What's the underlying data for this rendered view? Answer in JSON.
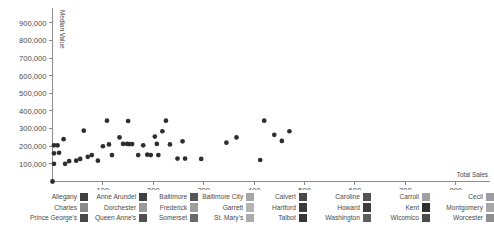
{
  "chart_data": {
    "type": "scatter",
    "title": "",
    "xlabel": "Total Sales",
    "ylabel": "Median Value",
    "xlim": [
      0,
      860
    ],
    "ylim": [
      0,
      950000
    ],
    "xticks": [
      100,
      200,
      300,
      400,
      500,
      600,
      700,
      800
    ],
    "yticks": [
      100000,
      200000,
      300000,
      400000,
      500000,
      600000,
      700000,
      800000,
      900000
    ],
    "xtick_labels": [
      "100",
      "200",
      "300",
      "400",
      "500",
      "600",
      "700",
      "800"
    ],
    "ytick_labels": [
      "100,000",
      "200,000",
      "300,000",
      "400,000",
      "500,000",
      "600,000",
      "700,000",
      "800,000",
      "900,000"
    ],
    "grid": false,
    "legend_position": "bottom",
    "marker_color": "#2e2e2e",
    "points": [
      {
        "name": "Allegany",
        "x": 8,
        "y": 100000
      },
      {
        "name": "Anne Arundel",
        "x": 300,
        "y": 345000
      },
      {
        "name": "Baltimore",
        "x": 440,
        "y": 265000
      },
      {
        "name": "Baltimore City",
        "x": 415,
        "y": 122000
      },
      {
        "name": "Calvert",
        "x": 80,
        "y": 330000
      },
      {
        "name": "Caroline",
        "x": 20,
        "y": 205000
      },
      {
        "name": "Carroll",
        "x": 150,
        "y": 285000
      },
      {
        "name": "Cecil",
        "x": 120,
        "y": 213000
      },
      {
        "name": "Charles",
        "x": 250,
        "y": 250000
      },
      {
        "name": "Dorchester",
        "x": 30,
        "y": 147000
      },
      {
        "name": "Frederick",
        "x": 205,
        "y": 213000
      },
      {
        "name": "Garrett",
        "x": 10,
        "y": 200000
      },
      {
        "name": "Harford",
        "x": 175,
        "y": 130000
      },
      {
        "name": "Howard",
        "x": 375,
        "y": 230000
      },
      {
        "name": "Kent",
        "x": 60,
        "y": 118000
      },
      {
        "name": "Montgomery",
        "x": 470,
        "y": 285000
      },
      {
        "name": "Prince George's",
        "x": 325,
        "y": 260000
      },
      {
        "name": "Queen Anne's",
        "x": 35,
        "y": 240000
      },
      {
        "name": "St. Mary's",
        "x": 95,
        "y": 142000
      },
      {
        "name": "Somerset",
        "x": 225,
        "y": 215000
      },
      {
        "name": "Talbot",
        "x": 135,
        "y": 205000
      },
      {
        "name": "Washington",
        "x": 255,
        "y": 215000
      },
      {
        "name": "Wicomico",
        "x": 185,
        "y": 215000
      },
      {
        "name": "Worcester",
        "x": 265,
        "y": 212000
      }
    ],
    "scatter_xy": [
      [
        3,
        205000
      ],
      [
        3,
        160000
      ],
      [
        3,
        100000
      ],
      [
        10,
        205000
      ],
      [
        13,
        163000
      ],
      [
        22,
        240000
      ],
      [
        25,
        100000
      ],
      [
        33,
        115000
      ],
      [
        47,
        118000
      ],
      [
        55,
        128000
      ],
      [
        62,
        288000
      ],
      [
        70,
        140000
      ],
      [
        78,
        150000
      ],
      [
        90,
        118000
      ],
      [
        100,
        200000
      ],
      [
        108,
        345000
      ],
      [
        112,
        210000
      ],
      [
        118,
        150000
      ],
      [
        133,
        250000
      ],
      [
        140,
        213000
      ],
      [
        148,
        213000
      ],
      [
        150,
        343000
      ],
      [
        152,
        212000
      ],
      [
        158,
        212000
      ],
      [
        170,
        150000
      ],
      [
        180,
        205000
      ],
      [
        188,
        152000
      ],
      [
        195,
        150000
      ],
      [
        203,
        255000
      ],
      [
        207,
        213000
      ],
      [
        210,
        150000
      ],
      [
        218,
        285000
      ],
      [
        225,
        345000
      ],
      [
        233,
        210000
      ],
      [
        248,
        130000
      ],
      [
        258,
        228000
      ],
      [
        263,
        130000
      ],
      [
        295,
        128000
      ],
      [
        345,
        220000
      ],
      [
        365,
        250000
      ],
      [
        412,
        122000
      ],
      [
        420,
        345000
      ],
      [
        440,
        265000
      ],
      [
        455,
        230000
      ],
      [
        470,
        285000
      ]
    ]
  },
  "axes": {
    "y_label": "Median Value",
    "x_label": "Total Sales"
  },
  "legend": {
    "columns": [
      {
        "entries": [
          {
            "label": "Allegany",
            "color": "#3f3f3f"
          },
          {
            "label": "Charles",
            "color": "#8a8a8a"
          },
          {
            "label": "Prince George's",
            "color": "#4a4a4a"
          }
        ]
      },
      {
        "entries": [
          {
            "label": "Anne Arundel",
            "color": "#404040"
          },
          {
            "label": "Dorchester",
            "color": "#9a9a9a"
          },
          {
            "label": "Queen Anne's",
            "color": "#4f4f4f"
          }
        ]
      },
      {
        "entries": [
          {
            "label": "Baltimore",
            "color": "#565656"
          },
          {
            "label": "Frederick",
            "color": "#9e9e9e"
          },
          {
            "label": "Somerset",
            "color": "#6a6a6a"
          }
        ]
      },
      {
        "entries": [
          {
            "label": "Baltimore City",
            "color": "#a6a6a6"
          },
          {
            "label": "Garrett",
            "color": "#b4b4b4"
          },
          {
            "label": "St. Mary's",
            "color": "#acacac"
          }
        ]
      },
      {
        "entries": [
          {
            "label": "Calvert",
            "color": "#4a4a4a"
          },
          {
            "label": "Hartford",
            "color": "#3b3b3b"
          },
          {
            "label": "Talbot",
            "color": "#363636"
          }
        ]
      },
      {
        "entries": [
          {
            "label": "Caroline",
            "color": "#525252"
          },
          {
            "label": "Howard",
            "color": "#3d3d3d"
          },
          {
            "label": "Washington",
            "color": "#5e5e5e"
          }
        ]
      },
      {
        "entries": [
          {
            "label": "Carroll",
            "color": "#a0a0a0"
          },
          {
            "label": "Kent",
            "color": "#2f2f2f"
          },
          {
            "label": "Wicomico",
            "color": "#4c4c4c"
          }
        ]
      },
      {
        "entries": [
          {
            "label": "Cecil",
            "color": "#9c9c9c"
          },
          {
            "label": "Montgomery",
            "color": "#a8a8a8"
          },
          {
            "label": "Worcester",
            "color": "#8e8e8e"
          }
        ]
      }
    ]
  }
}
